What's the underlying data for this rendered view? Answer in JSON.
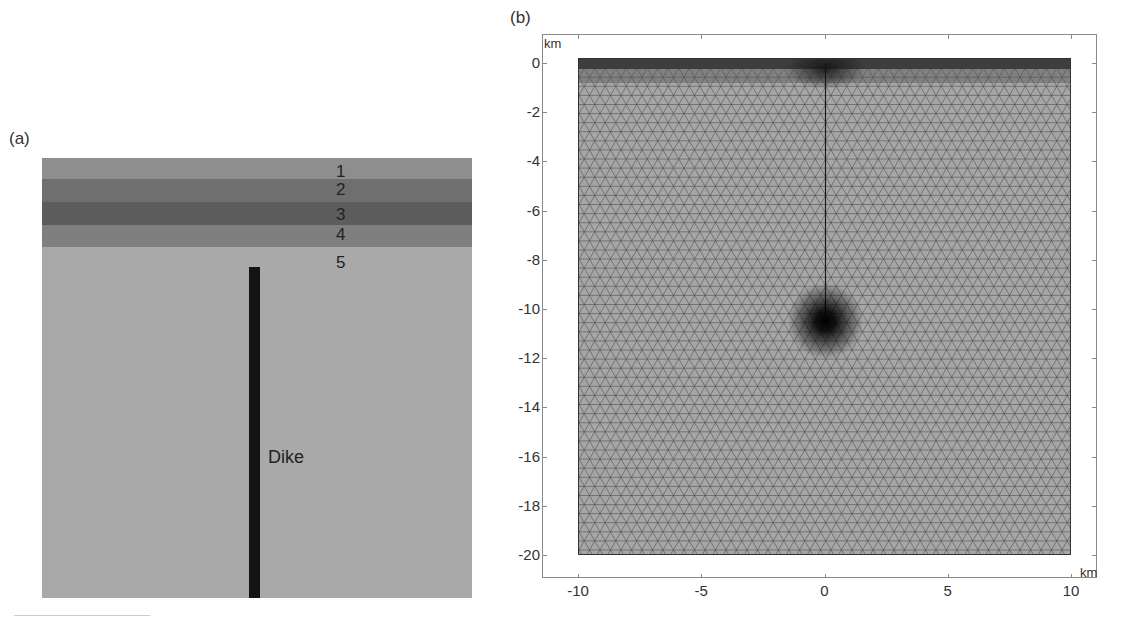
{
  "panel_a": {
    "label": "(a)",
    "layers": [
      {
        "num": "1",
        "color": "#8e8e8e",
        "top": 0,
        "height": 21
      },
      {
        "num": "2",
        "color": "#6f6f6f",
        "top": 21,
        "height": 23
      },
      {
        "num": "3",
        "color": "#5d5d5d",
        "top": 44,
        "height": 23
      },
      {
        "num": "4",
        "color": "#7f7f7f",
        "top": 67,
        "height": 22
      },
      {
        "num": "5",
        "color": "#a9a9a9",
        "top": 89,
        "height": 351
      }
    ],
    "dike_label": "Dike"
  },
  "panel_b": {
    "label": "(b)",
    "y_unit": "km",
    "x_unit": "km",
    "y_ticks": [
      "0",
      "-2",
      "-4",
      "-6",
      "-8",
      "-10",
      "-12",
      "-14",
      "-16",
      "-18",
      "-20"
    ],
    "x_ticks": [
      "-10",
      "-5",
      "0",
      "5",
      "10"
    ]
  },
  "chart_data": {
    "type": "mesh",
    "xlabel": "km",
    "ylabel": "km",
    "xlim": [
      -10,
      10
    ],
    "ylim": [
      -20,
      0
    ],
    "x_ticks": [
      -10,
      -5,
      0,
      5,
      10
    ],
    "y_ticks": [
      0,
      -2,
      -4,
      -6,
      -8,
      -10,
      -12,
      -14,
      -16,
      -18,
      -20
    ],
    "features": [
      {
        "name": "dike",
        "x": 0,
        "y_top": -0.5,
        "y_bottom": -10.5
      },
      {
        "name": "refinement-at-dike-tip",
        "x": 0,
        "y": -10.5
      },
      {
        "name": "refinement-near-surface",
        "x": 0,
        "y": 0
      },
      {
        "name": "fine-surface-layers",
        "y_range": [
          -1,
          0
        ]
      }
    ],
    "grid": false
  }
}
